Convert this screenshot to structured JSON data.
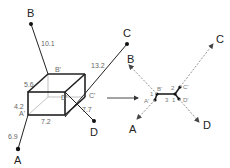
{
  "diagram": {
    "left": {
      "points": {
        "A": "A",
        "B": "B",
        "C": "C",
        "D": "D"
      },
      "cube_corners": {
        "A": "A'",
        "B": "B'",
        "C": "C'",
        "D": "D'"
      },
      "lengths": {
        "B_to_cube": "10.1",
        "C_to_cube": "13.2",
        "D_to_cube": "7.7",
        "A_to_cube": "6.9",
        "edge_depth": "5.6",
        "edge_height": "4.2",
        "edge_width": "7.2"
      }
    },
    "right": {
      "points": {
        "A": "A",
        "B": "B",
        "C": "C",
        "D": "D"
      },
      "corners": {
        "A": "A'",
        "B": "B'",
        "C": "C'",
        "D": "D'"
      },
      "lengths": {
        "AB": "1",
        "BC": "3",
        "C_top": "2",
        "D_short": "1"
      }
    },
    "colors": {
      "line": "#222222",
      "label": "#666666",
      "dashed": "#888888"
    }
  }
}
